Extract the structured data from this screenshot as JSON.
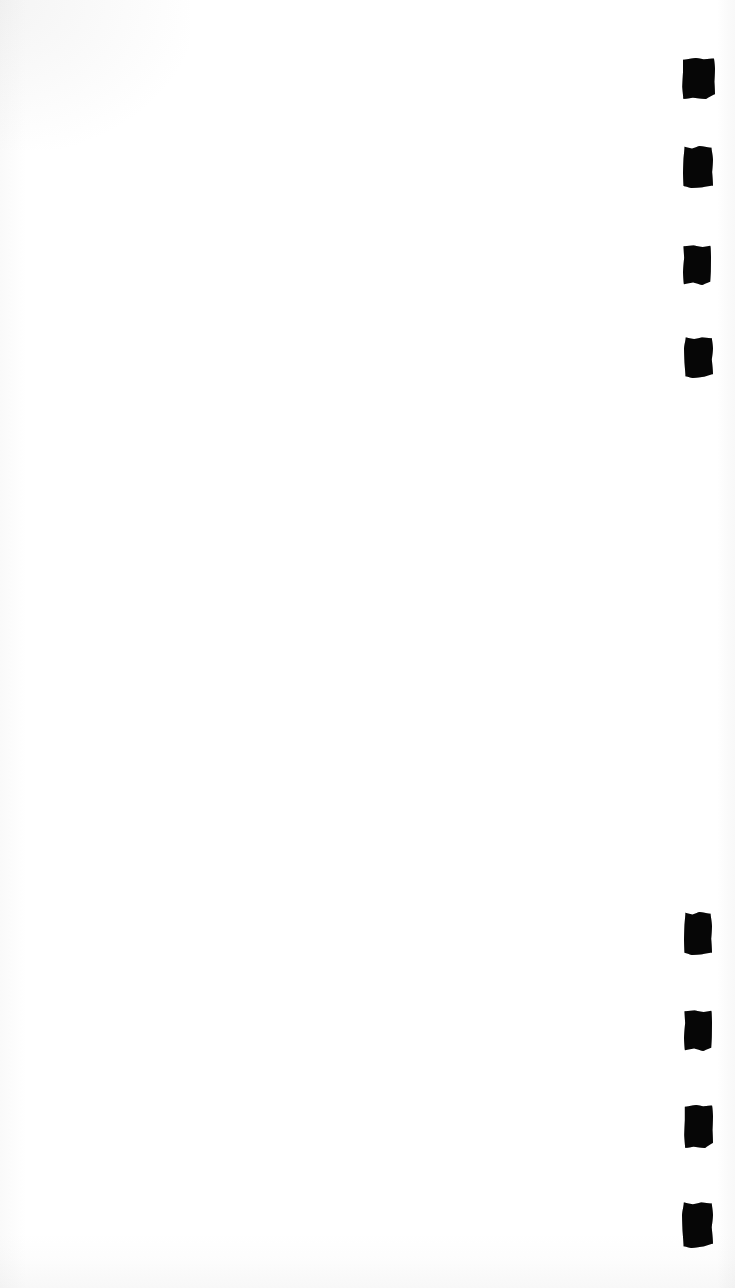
{
  "document": {
    "kind": "scanned-page",
    "page_background_color": "#ffffff",
    "mark_color": "#060606",
    "canvas": {
      "width": 735,
      "height": 1288
    },
    "visible_text": "",
    "body_text": ""
  },
  "marks": {
    "label": "registration-marks",
    "count": 8,
    "groups": [
      {
        "name": "upper-mark-group",
        "count": 4,
        "items": [
          {
            "id": "mark-1",
            "x": 682,
            "y": 58,
            "w": 33,
            "h": 41,
            "shape": "v1"
          },
          {
            "id": "mark-2",
            "x": 683,
            "y": 146,
            "w": 30,
            "h": 42,
            "shape": "v2"
          },
          {
            "id": "mark-3",
            "x": 683,
            "y": 245,
            "w": 28,
            "h": 40,
            "shape": "v3"
          },
          {
            "id": "mark-4",
            "x": 684,
            "y": 337,
            "w": 29,
            "h": 41,
            "shape": "v4"
          }
        ]
      },
      {
        "name": "lower-mark-group",
        "count": 4,
        "items": [
          {
            "id": "mark-5",
            "x": 684,
            "y": 912,
            "w": 28,
            "h": 43,
            "shape": "v2"
          },
          {
            "id": "mark-6",
            "x": 684,
            "y": 1010,
            "w": 28,
            "h": 41,
            "shape": "v3"
          },
          {
            "id": "mark-7",
            "x": 684,
            "y": 1105,
            "w": 29,
            "h": 43,
            "shape": "v1"
          },
          {
            "id": "mark-8",
            "x": 682,
            "y": 1202,
            "w": 31,
            "h": 46,
            "shape": "v4"
          }
        ]
      }
    ]
  }
}
